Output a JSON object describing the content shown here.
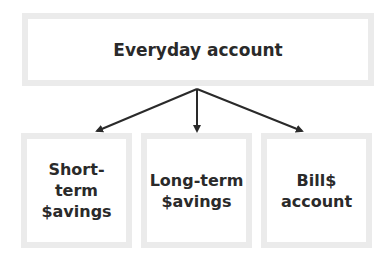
{
  "diagram": {
    "root": {
      "label": "Everyday account"
    },
    "children": [
      {
        "label": "Short-term\n$avings"
      },
      {
        "label": "Long-term\n$avings"
      },
      {
        "label": "Bill$\naccount"
      }
    ],
    "colors": {
      "box_border": "#ebebeb",
      "text": "#2a2a2a",
      "arrow": "#2a2a2a"
    }
  }
}
